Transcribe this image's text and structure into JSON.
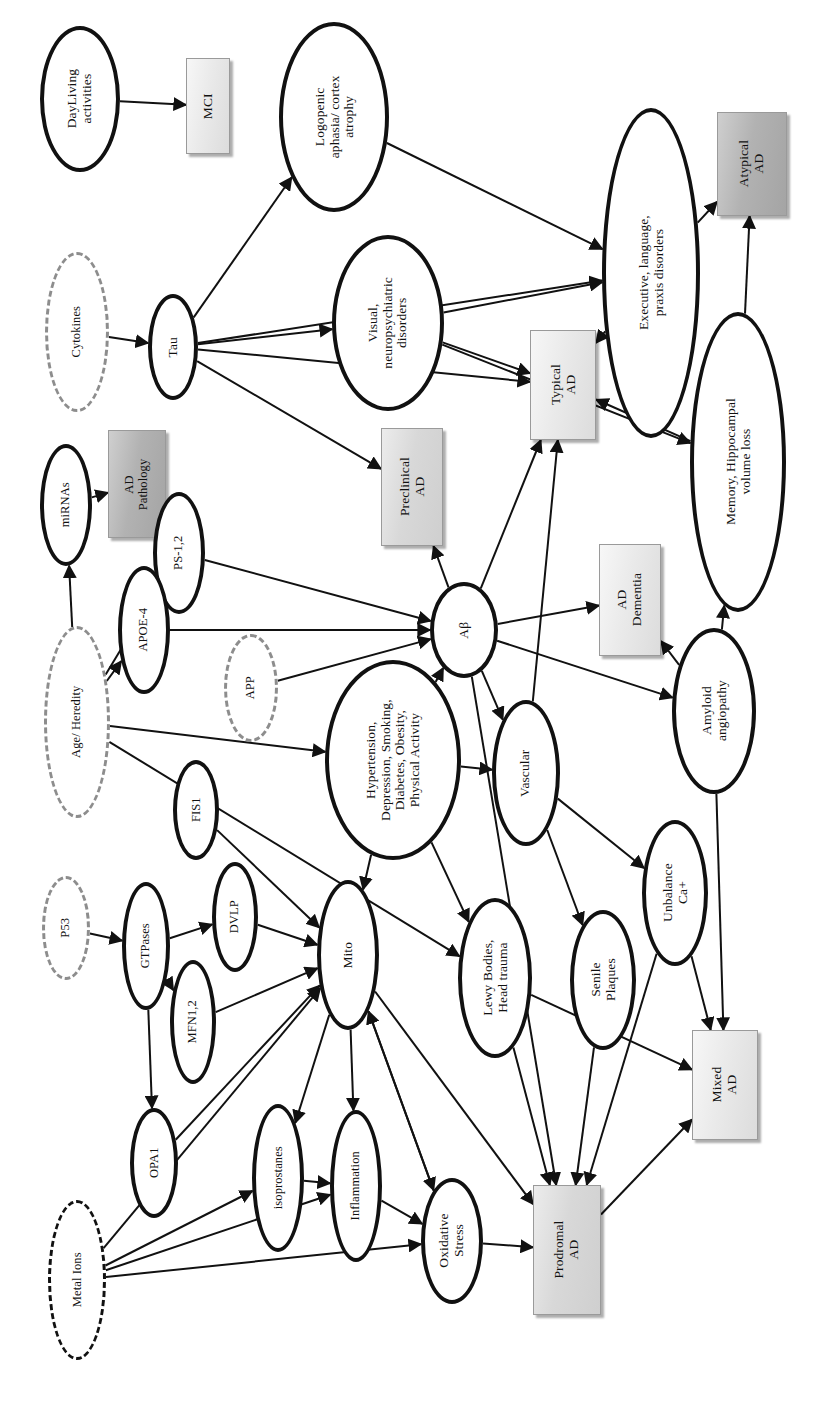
{
  "figure": {
    "orientation": "rotated-90-ccw",
    "legend": {
      "solid_ellipse": "process / marker node",
      "dashed_ellipse": "external or modulating factor",
      "shaded_box": "clinical stage / outcome"
    },
    "colors": {
      "node_stroke": "#111111",
      "dashed_stroke": "#8d8d8d",
      "box_light": "#eaeaea",
      "box_medium": "#d8d8d8",
      "box_dark": "#b2b2b2",
      "edge": "#111111",
      "background": "#ffffff"
    }
  },
  "nodes": [
    {
      "id": "dayliving",
      "label": "DayLiving\nactivities",
      "shape": "ellipse",
      "x": 40,
      "y": 26,
      "w": 80,
      "h": 146,
      "font": "fs13"
    },
    {
      "id": "mci",
      "label": "MCI",
      "shape": "box",
      "tone": "light",
      "x": 186,
      "y": 58,
      "w": 44,
      "h": 96,
      "font": "fs13"
    },
    {
      "id": "logopenic",
      "label": "Logopenic\naphasia/ cortex\natrophy",
      "shape": "ellipse",
      "x": 279,
      "y": 22,
      "w": 110,
      "h": 190,
      "font": "fs13"
    },
    {
      "id": "cytokines",
      "label": "Cytokines",
      "shape": "dashed",
      "x": 45,
      "y": 252,
      "w": 64,
      "h": 160,
      "font": "fs12"
    },
    {
      "id": "tau",
      "label": "Tau",
      "shape": "ellipse",
      "x": 148,
      "y": 294,
      "w": 50,
      "h": 106,
      "font": "fs13"
    },
    {
      "id": "visual",
      "label": "Visual,\nneuropsychiatric\ndisorders",
      "shape": "ellipse",
      "x": 332,
      "y": 235,
      "w": 112,
      "h": 176,
      "font": "fs13"
    },
    {
      "id": "executive",
      "label": "Executive, language,\npraxis disorders",
      "shape": "ellipse",
      "x": 602,
      "y": 108,
      "w": 98,
      "h": 330,
      "font": "fs13"
    },
    {
      "id": "atypical",
      "label": "Atypical\nAD",
      "shape": "box",
      "tone": "dark",
      "x": 717,
      "y": 112,
      "w": 70,
      "h": 104,
      "font": "fs13"
    },
    {
      "id": "mirnas",
      "label": "miRNAs",
      "shape": "ellipse",
      "x": 40,
      "y": 444,
      "w": 52,
      "h": 122,
      "font": "fs12"
    },
    {
      "id": "adpathology",
      "label": "AD\nPathology",
      "shape": "box",
      "tone": "dark",
      "x": 108,
      "y": 430,
      "w": 58,
      "h": 108,
      "font": "fs12"
    },
    {
      "id": "preclinical",
      "label": "Preclinical\nAD",
      "shape": "box",
      "tone": "medium",
      "x": 381,
      "y": 428,
      "w": 62,
      "h": 118,
      "font": "fs13"
    },
    {
      "id": "typical",
      "label": "Typical\nAD",
      "shape": "box",
      "tone": "light",
      "x": 530,
      "y": 330,
      "w": 66,
      "h": 110,
      "font": "fs13"
    },
    {
      "id": "memory",
      "label": "Memory, Hippocampal\nvolume loss",
      "shape": "ellipse",
      "x": 690,
      "y": 312,
      "w": 96,
      "h": 300,
      "font": "fs13"
    },
    {
      "id": "ps12",
      "label": "PS-1,2",
      "shape": "ellipse",
      "x": 153,
      "y": 492,
      "w": 52,
      "h": 122,
      "font": "fs12"
    },
    {
      "id": "apoe4",
      "label": "APOE-4",
      "shape": "ellipse",
      "x": 118,
      "y": 566,
      "w": 52,
      "h": 128,
      "font": "fs12"
    },
    {
      "id": "ab",
      "label": "Aβ",
      "shape": "ellipse",
      "x": 430,
      "y": 582,
      "w": 68,
      "h": 96,
      "font": "fs13"
    },
    {
      "id": "addementia",
      "label": "AD\nDementia",
      "shape": "box",
      "tone": "light",
      "x": 599,
      "y": 544,
      "w": 62,
      "h": 112,
      "font": "fs13"
    },
    {
      "id": "app",
      "label": "APP",
      "shape": "dashed",
      "x": 224,
      "y": 634,
      "w": 54,
      "h": 108,
      "font": "fs12"
    },
    {
      "id": "ageheredity",
      "label": "Age/ Heredity",
      "shape": "dashed",
      "x": 44,
      "y": 626,
      "w": 66,
      "h": 192,
      "font": "fs12"
    },
    {
      "id": "hypertension",
      "label": "Hypertension,\nDepression, Smoking,\nDiabetes, Obesity,\nPhysical Activity",
      "shape": "ellipse",
      "x": 325,
      "y": 660,
      "w": 136,
      "h": 200,
      "font": "fs13"
    },
    {
      "id": "vascular",
      "label": "Vascular",
      "shape": "ellipse",
      "x": 492,
      "y": 700,
      "w": 68,
      "h": 146,
      "font": "fs13"
    },
    {
      "id": "amyloid",
      "label": "Amyloid\nangiopathy",
      "shape": "ellipse",
      "x": 672,
      "y": 628,
      "w": 84,
      "h": 166,
      "font": "fs13"
    },
    {
      "id": "fis1",
      "label": "FIS1",
      "shape": "ellipse",
      "x": 173,
      "y": 760,
      "w": 46,
      "h": 100,
      "font": "fs12"
    },
    {
      "id": "p53",
      "label": "P53",
      "shape": "dashed",
      "x": 42,
      "y": 876,
      "w": 48,
      "h": 104,
      "font": "fs12"
    },
    {
      "id": "gtpases",
      "label": "GTPases",
      "shape": "ellipse",
      "x": 122,
      "y": 882,
      "w": 48,
      "h": 128,
      "font": "fs12"
    },
    {
      "id": "dvlp",
      "label": "DVLP",
      "shape": "ellipse",
      "x": 212,
      "y": 862,
      "w": 46,
      "h": 110,
      "font": "fs12"
    },
    {
      "id": "mfn12",
      "label": "MFN1,2",
      "shape": "ellipse",
      "x": 170,
      "y": 960,
      "w": 46,
      "h": 124,
      "font": "fs12"
    },
    {
      "id": "mito",
      "label": "Mito",
      "shape": "ellipse",
      "x": 317,
      "y": 880,
      "w": 62,
      "h": 150,
      "font": "fs13"
    },
    {
      "id": "lewy",
      "label": "Lewy Bodies,\nHead trauma",
      "shape": "ellipse",
      "x": 458,
      "y": 898,
      "w": 74,
      "h": 160,
      "font": "fs13"
    },
    {
      "id": "senile",
      "label": "Senile\nPlaques",
      "shape": "ellipse",
      "x": 570,
      "y": 910,
      "w": 66,
      "h": 140,
      "font": "fs13"
    },
    {
      "id": "unbalance",
      "label": "Unbalance\nCa+",
      "shape": "ellipse",
      "x": 642,
      "y": 820,
      "w": 66,
      "h": 146,
      "font": "fs13"
    },
    {
      "id": "opa1",
      "label": "OPA1",
      "shape": "ellipse",
      "x": 130,
      "y": 1108,
      "w": 48,
      "h": 110,
      "font": "fs12"
    },
    {
      "id": "isoprostanes",
      "label": "isoprostanes",
      "shape": "ellipse",
      "x": 252,
      "y": 1104,
      "w": 52,
      "h": 148,
      "font": "fs12"
    },
    {
      "id": "inflammation",
      "label": "Inflammation",
      "shape": "ellipse",
      "x": 330,
      "y": 1110,
      "w": 52,
      "h": 152,
      "font": "fs12"
    },
    {
      "id": "oxidative",
      "label": "Oxidative\nStress",
      "shape": "ellipse",
      "x": 421,
      "y": 1178,
      "w": 62,
      "h": 126,
      "font": "fs13"
    },
    {
      "id": "metalions",
      "label": "Metal Ions",
      "shape": "dashed",
      "tone": "dark",
      "x": 48,
      "y": 1200,
      "w": 58,
      "h": 160,
      "font": "fs12"
    },
    {
      "id": "prodromal",
      "label": "Prodromal\nAD",
      "shape": "box",
      "tone": "medium",
      "x": 533,
      "y": 1185,
      "w": 68,
      "h": 130,
      "font": "fs13"
    },
    {
      "id": "mixed",
      "label": "Mixed\nAD",
      "shape": "box",
      "tone": "light",
      "x": 692,
      "y": 1030,
      "w": 66,
      "h": 110,
      "font": "fs13"
    }
  ],
  "edges": [
    {
      "from": "dayliving",
      "to": "mci"
    },
    {
      "from": "cytokines",
      "to": "tau"
    },
    {
      "from": "tau",
      "to": "logopenic"
    },
    {
      "from": "tau",
      "to": "visual"
    },
    {
      "from": "tau",
      "to": "typical"
    },
    {
      "from": "tau",
      "to": "preclinical"
    },
    {
      "from": "tau",
      "to": "executive"
    },
    {
      "from": "logopenic",
      "to": "executive"
    },
    {
      "from": "visual",
      "to": "executive"
    },
    {
      "from": "visual",
      "to": "typical"
    },
    {
      "from": "visual",
      "to": "memory"
    },
    {
      "from": "executive",
      "to": "atypical"
    },
    {
      "from": "executive",
      "to": "typical"
    },
    {
      "from": "memory",
      "to": "atypical"
    },
    {
      "from": "memory",
      "to": "typical"
    },
    {
      "from": "ageheredity",
      "to": "mirnas"
    },
    {
      "from": "mirnas",
      "to": "adpathology"
    },
    {
      "from": "ageheredity",
      "to": "ps12"
    },
    {
      "from": "ageheredity",
      "to": "apoe4"
    },
    {
      "from": "ageheredity",
      "to": "hypertension"
    },
    {
      "from": "ageheredity",
      "to": "lewy"
    },
    {
      "from": "ps12",
      "to": "ab"
    },
    {
      "from": "apoe4",
      "to": "ab"
    },
    {
      "from": "app",
      "to": "ab"
    },
    {
      "from": "hypertension",
      "to": "ab"
    },
    {
      "from": "ab",
      "to": "preclinical"
    },
    {
      "from": "ab",
      "to": "typical"
    },
    {
      "from": "ab",
      "to": "addementia"
    },
    {
      "from": "ab",
      "to": "vascular"
    },
    {
      "from": "ab",
      "to": "amyloid"
    },
    {
      "from": "ab",
      "to": "prodromal"
    },
    {
      "from": "hypertension",
      "to": "vascular"
    },
    {
      "from": "hypertension",
      "to": "lewy"
    },
    {
      "from": "hypertension",
      "to": "mito"
    },
    {
      "from": "vascular",
      "to": "senile"
    },
    {
      "from": "vascular",
      "to": "unbalance"
    },
    {
      "from": "vascular",
      "to": "typical"
    },
    {
      "from": "amyloid",
      "to": "addementia"
    },
    {
      "from": "amyloid",
      "to": "memory"
    },
    {
      "from": "amyloid",
      "to": "mixed"
    },
    {
      "from": "unbalance",
      "to": "mixed"
    },
    {
      "from": "unbalance",
      "to": "prodromal"
    },
    {
      "from": "senile",
      "to": "prodromal"
    },
    {
      "from": "lewy",
      "to": "prodromal"
    },
    {
      "from": "lewy",
      "to": "mixed"
    },
    {
      "from": "p53",
      "to": "gtpases"
    },
    {
      "from": "gtpases",
      "to": "dvlp"
    },
    {
      "from": "gtpases",
      "to": "mfn12"
    },
    {
      "from": "gtpases",
      "to": "opa1"
    },
    {
      "from": "fis1",
      "to": "mito"
    },
    {
      "from": "dvlp",
      "to": "mito"
    },
    {
      "from": "mfn12",
      "to": "mito"
    },
    {
      "from": "opa1",
      "to": "mito"
    },
    {
      "from": "mito",
      "to": "isoprostanes"
    },
    {
      "from": "mito",
      "to": "inflammation"
    },
    {
      "from": "mito",
      "to": "oxidative"
    },
    {
      "from": "mito",
      "to": "prodromal"
    },
    {
      "from": "isoprostanes",
      "to": "inflammation"
    },
    {
      "from": "inflammation",
      "to": "oxidative"
    },
    {
      "from": "oxidative",
      "to": "prodromal"
    },
    {
      "from": "oxidative",
      "to": "mito"
    },
    {
      "from": "metalions",
      "to": "isoprostanes"
    },
    {
      "from": "metalions",
      "to": "inflammation"
    },
    {
      "from": "metalions",
      "to": "oxidative"
    },
    {
      "from": "metalions",
      "to": "mito"
    },
    {
      "from": "prodromal",
      "to": "mixed"
    }
  ]
}
